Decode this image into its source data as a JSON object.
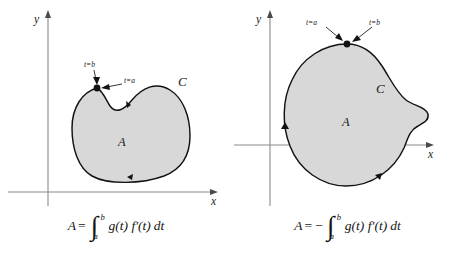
{
  "figure": {
    "panels": [
      {
        "id": "left",
        "axis_x_label": "x",
        "axis_y_label": "y",
        "region_label": "A",
        "curve_label": "C",
        "point_labels": {
          "left": "t=b",
          "right": "t=a"
        },
        "orientation": "clockwise",
        "formula": {
          "lhs": "A",
          "equals": "=",
          "sign": "",
          "integral_glyph": "∫",
          "upper_limit": "b",
          "lower_limit": "a",
          "integrand": "g(t) f′(t)",
          "differential": "dt",
          "plain": "A = ∫ₐᵇ g(t) f′(t) dt"
        }
      },
      {
        "id": "right",
        "axis_x_label": "x",
        "axis_y_label": "y",
        "region_label": "A",
        "curve_label": "C",
        "point_labels": {
          "left": "t=a",
          "right": "t=b"
        },
        "orientation": "counterclockwise",
        "formula": {
          "lhs": "A",
          "equals": "=",
          "sign": "−",
          "integral_glyph": "∫",
          "upper_limit": "b",
          "lower_limit": "a",
          "integrand": "g(t) f′(t)",
          "differential": "dt",
          "plain": "A = −∫ₐᵇ g(t) f′(t) dt"
        }
      }
    ],
    "colors": {
      "region_fill": "#d8d8d8",
      "curve_stroke": "#121212",
      "axis_stroke": "#8a8a8a",
      "text": "#1a1a1a",
      "background": "#ffffff"
    }
  }
}
